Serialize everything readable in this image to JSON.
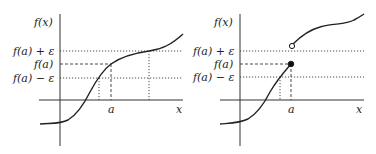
{
  "diagrams": [
    {
      "id": "continuous",
      "y_axis_label": "f(x)",
      "x_axis_label": "x",
      "x_tick_label": "a",
      "y_labels": {
        "upper": "f(a) + ε",
        "center": "f(a)",
        "lower": "f(a) − ε"
      },
      "description": "Continuous function at a: neighborhood of a maps into (f(a)−ε, f(a)+ε)"
    },
    {
      "id": "discontinuous",
      "y_axis_label": "f(x)",
      "x_axis_label": "x",
      "x_tick_label": "a",
      "y_labels": {
        "upper": "f(a) + ε",
        "center": "f(a)",
        "lower": "f(a) − ε"
      },
      "markers": {
        "filled_point": "f(a)",
        "open_point": "right-limit above f(a)+ε"
      },
      "description": "Jump discontinuity at a: function jumps above f(a)+ε immediately to the right of a"
    }
  ]
}
